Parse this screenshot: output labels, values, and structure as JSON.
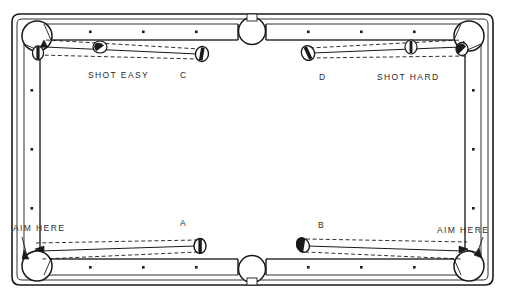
{
  "figure": {
    "type": "billiards-table-diagram",
    "width": 505,
    "height": 299,
    "colors": {
      "line": "#1a1a1a",
      "background": "#ffffff",
      "text": "#2b2b2b",
      "ball_fill": "#ffffff"
    }
  },
  "annotations": {
    "shot_easy": "SHOT EASY",
    "shot_hard": "SHOT HARD",
    "aim_here_left": "AIM HERE",
    "aim_here_right": "AIM HERE",
    "label_a": "A",
    "label_b": "B",
    "label_c": "C",
    "label_d": "D"
  },
  "table": {
    "rails": {
      "top_left_diamonds": 3,
      "top_right_diamonds": 3,
      "bottom_left_diamonds": 3,
      "bottom_right_diamonds": 3,
      "left_diamonds": 3,
      "right_diamonds": 3
    },
    "pockets": [
      {
        "name": "top-left-corner-pocket",
        "cx": 36,
        "cy": 35
      },
      {
        "name": "top-side-pocket",
        "cx": 252,
        "cy": 29
      },
      {
        "name": "top-right-corner-pocket",
        "cx": 469,
        "cy": 35
      },
      {
        "name": "bottom-left-corner-pocket",
        "cx": 36,
        "cy": 266
      },
      {
        "name": "bottom-side-pocket",
        "cx": 252,
        "cy": 272
      },
      {
        "name": "bottom-right-corner-pocket",
        "cx": 469,
        "cy": 266
      }
    ]
  },
  "shots": [
    {
      "id": "C",
      "label": "C",
      "difficulty": "SHOT EASY",
      "object_ball": {
        "cx": 202,
        "cy": 54
      },
      "cue_ball": {
        "cx": 100,
        "cy": 46
      },
      "target_pocket": "top-left-corner-pocket"
    },
    {
      "id": "D",
      "label": "D",
      "difficulty": "SHOT HARD",
      "object_ball": {
        "cx": 308,
        "cy": 53
      },
      "cue_ball": {
        "cx": 411,
        "cy": 47
      },
      "target_pocket": "top-right-corner-pocket"
    },
    {
      "id": "A",
      "label": "A",
      "difficulty": "AIM HERE",
      "object_ball": {
        "cx": 200,
        "cy": 246
      },
      "cue_ball": null,
      "target_pocket": "bottom-left-corner-pocket"
    },
    {
      "id": "B",
      "label": "B",
      "difficulty": "AIM HERE",
      "object_ball": {
        "cx": 303,
        "cy": 245
      },
      "cue_ball": null,
      "target_pocket": "bottom-right-corner-pocket"
    }
  ]
}
